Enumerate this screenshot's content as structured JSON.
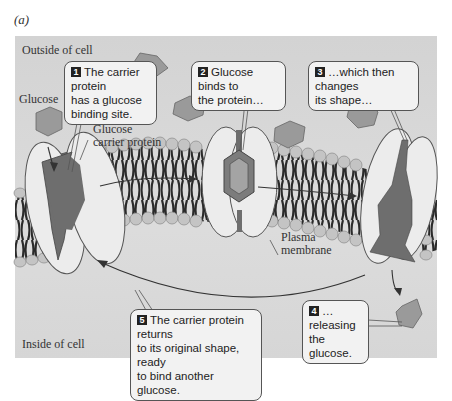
{
  "figure": {
    "panel_label": "(a)",
    "regions": {
      "outside": "Outside of cell",
      "inside": "Inside of cell"
    },
    "labels": {
      "glucose": "Glucose",
      "carrier_line1": "Glucose",
      "carrier_line2": "carrier protein",
      "membrane_line1": "Plasma",
      "membrane_line2": "membrane"
    },
    "steps": [
      {
        "num": "1",
        "line1": "The carrier protein",
        "line2": "has a glucose",
        "line3": "binding site."
      },
      {
        "num": "2",
        "line1": "Glucose binds to",
        "line2": "the protein…"
      },
      {
        "num": "3",
        "line1": "…which then changes",
        "line2": "its shape…"
      },
      {
        "num": "4",
        "line1": "… releasing",
        "line2": "the glucose."
      },
      {
        "num": "5",
        "line1": "The carrier protein returns",
        "line2": "to its original shape, ready",
        "line3": "to bind another glucose."
      }
    ],
    "colors": {
      "background_panel": "#d6d6d6",
      "protein_fill": "#ececec",
      "channel_dark": "#6e6e6e",
      "glucose_fill": "#9a9a9a",
      "lipid_head": "#c4c4c4",
      "lipid_tail": "#2a2a2a",
      "callout_fill": "#f2f2f2"
    }
  }
}
